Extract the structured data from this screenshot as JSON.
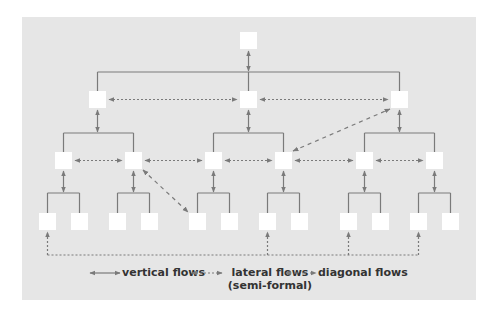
{
  "diagram": {
    "colors": {
      "panel": "#e6e6e6",
      "box": "#ffffff",
      "line": "#7a7a7a"
    },
    "nodes": {
      "top": [
        {
          "x": 240,
          "y": 32
        }
      ],
      "level1": [
        {
          "x": 89,
          "y": 91
        },
        {
          "x": 240,
          "y": 91
        },
        {
          "x": 391,
          "y": 91
        }
      ],
      "level2": [
        {
          "x": 55,
          "y": 152
        },
        {
          "x": 125,
          "y": 152
        },
        {
          "x": 205,
          "y": 152
        },
        {
          "x": 275,
          "y": 152
        },
        {
          "x": 356,
          "y": 152
        },
        {
          "x": 426,
          "y": 152
        }
      ],
      "level3": [
        {
          "x": 39,
          "y": 213
        },
        {
          "x": 71,
          "y": 213
        },
        {
          "x": 109,
          "y": 213
        },
        {
          "x": 141,
          "y": 213
        },
        {
          "x": 189,
          "y": 213
        },
        {
          "x": 221,
          "y": 213
        },
        {
          "x": 259,
          "y": 213
        },
        {
          "x": 291,
          "y": 213
        },
        {
          "x": 340,
          "y": 213
        },
        {
          "x": 372,
          "y": 213
        },
        {
          "x": 410,
          "y": 213
        },
        {
          "x": 442,
          "y": 213
        }
      ]
    },
    "box_size": 17
  },
  "legend": {
    "vertical": "vertical flows",
    "lateral": "lateral flows",
    "lateral_sub": "(semi-formal)",
    "diagonal": "diagonal flows"
  }
}
